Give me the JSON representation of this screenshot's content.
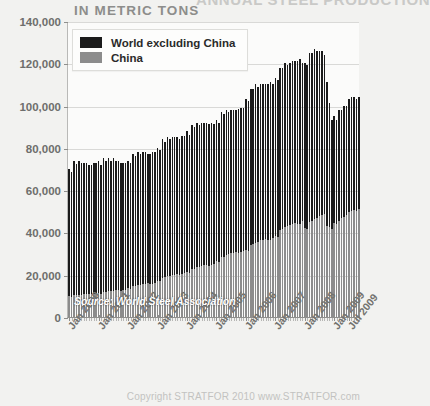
{
  "header": {
    "cut_title": "ANNUAL STEEL PRODUCTION",
    "subtitle": "IN METRIC TONS"
  },
  "legend": {
    "items": [
      {
        "label": "World excluding China",
        "color": "#1b1b1b",
        "key": "world_ex_china"
      },
      {
        "label": "China",
        "color": "#8c8c8c",
        "key": "china"
      }
    ]
  },
  "source_note": "Source: World Steel Association",
  "footer": "Copyright STRATFOR 2010   www.STRATFOR.com",
  "colors": {
    "world_ex_china": "#1b1b1b",
    "china": "#8c8c8c",
    "background": "#f2f2f0",
    "plot_background": "#fbfbfa",
    "gridline": "#d9d9d7",
    "axis": "#8f8f8d",
    "tick_label": "#6e6e6c"
  },
  "chart_data": {
    "type": "bar",
    "stacked": true,
    "title": "ANNUAL STEEL PRODUCTION",
    "subtitle": "IN METRIC TONS",
    "xlabel": "",
    "ylabel": "",
    "ylim": [
      0,
      140000
    ],
    "yticks": [
      0,
      20000,
      40000,
      60000,
      80000,
      100000,
      120000,
      140000
    ],
    "ytick_labels": [
      "0",
      "20,000",
      "40,000",
      "60,000",
      "80,000",
      "100,000",
      "120,000",
      "140,000"
    ],
    "grid": true,
    "legend_position": "top-left",
    "x_tick_labels": [
      "Jan 2000",
      "Jan 2001",
      "Jan 2002",
      "Jan 2003",
      "Jan 2004",
      "Jan 2005",
      "Jan 2006",
      "Jan 2007",
      "Jan 2008",
      "Jan 2009",
      "Jul 2009"
    ],
    "x_tick_indices": [
      0,
      12,
      24,
      36,
      48,
      60,
      72,
      84,
      96,
      108,
      114
    ],
    "x_start": "Jan 2000",
    "x_end": "Nov 2009",
    "n_points": 119,
    "series": [
      {
        "name": "China",
        "color": "#8c8c8c",
        "values": [
          9800,
          9600,
          10400,
          10300,
          10600,
          10500,
          10700,
          10800,
          10900,
          10700,
          10800,
          11100,
          11200,
          11000,
          12000,
          11900,
          12300,
          12200,
          12500,
          12600,
          12700,
          12500,
          12600,
          13000,
          13600,
          13400,
          14700,
          14800,
          15200,
          15300,
          15600,
          15800,
          15900,
          15700,
          15800,
          16300,
          17200,
          17100,
          18600,
          18800,
          19300,
          19400,
          19800,
          20100,
          20200,
          20000,
          20200,
          20800,
          21200,
          21000,
          22700,
          22900,
          23500,
          23700,
          24200,
          24500,
          24600,
          24300,
          24500,
          25200,
          26400,
          26200,
          28300,
          28600,
          29300,
          29600,
          30200,
          30500,
          30700,
          30400,
          30600,
          31400,
          31600,
          31400,
          33900,
          34300,
          35100,
          35500,
          36200,
          36600,
          36800,
          36400,
          36600,
          37500,
          38200,
          38000,
          41000,
          41400,
          42400,
          42900,
          43700,
          44100,
          44400,
          43900,
          44100,
          45200,
          41900,
          41700,
          45000,
          45400,
          46500,
          47000,
          47900,
          48300,
          48600,
          43000,
          42500,
          41500,
          44500,
          43800,
          45600,
          46900,
          47500,
          48100,
          49600,
          50200,
          50400,
          50100,
          51000
        ]
      },
      {
        "name": "World excluding China",
        "color": "#1b1b1b",
        "values": [
          60200,
          59100,
          63600,
          62200,
          63400,
          62500,
          62300,
          62200,
          61100,
          61300,
          62200,
          61900,
          62800,
          61000,
          63000,
          62100,
          62700,
          61800,
          62500,
          61400,
          61300,
          60500,
          60400,
          59900,
          60400,
          59600,
          62300,
          61200,
          62800,
          61700,
          62400,
          62200,
          61100,
          61300,
          62200,
          61700,
          62800,
          61900,
          65400,
          64200,
          65700,
          64600,
          65200,
          64900,
          64800,
          64300,
          65200,
          64700,
          66800,
          65000,
          68300,
          67100,
          68500,
          67300,
          67800,
          67500,
          67400,
          67000,
          67500,
          66200,
          66600,
          65800,
          68700,
          67400,
          68700,
          67400,
          67800,
          67500,
          67300,
          67900,
          68400,
          67600,
          71400,
          70600,
          74100,
          73700,
          74900,
          73500,
          73800,
          73600,
          73200,
          73600,
          74400,
          72500,
          74800,
          74000,
          77000,
          76600,
          77600,
          76100,
          76300,
          76900,
          76600,
          77100,
          77900,
          74800,
          78100,
          77300,
          80000,
          79600,
          80500,
          79000,
          78100,
          77700,
          75400,
          68000,
          58500,
          51500,
          50500,
          49200,
          52400,
          51100,
          52500,
          51900,
          53400,
          53800,
          53600,
          52900,
          53000
        ]
      }
    ]
  }
}
